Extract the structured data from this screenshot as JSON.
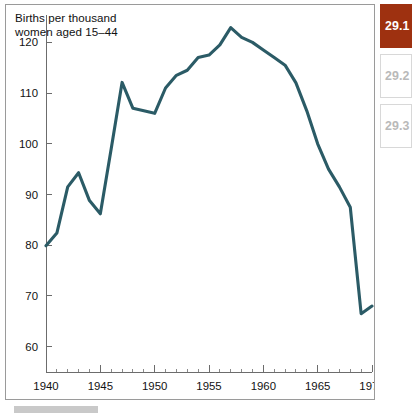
{
  "figure": {
    "title": "Births per thousand\nwomen aged 15–44"
  },
  "tabs": {
    "items": [
      {
        "label": "29.1",
        "state": "active"
      },
      {
        "label": "29.2",
        "state": "inactive"
      },
      {
        "label": "29.3",
        "state": "inactive"
      }
    ]
  },
  "colors": {
    "series_line": "#2b5b66",
    "active_tab_bg": "#9e3110",
    "active_tab_text": "#ffffff",
    "inactive_tab_text": "#b9b9b9",
    "inactive_tab_border": "#d8d8d8",
    "panel_border": "#9a9a9a",
    "axis": "#6c6c6c",
    "caption_bar": "#c9c9c9",
    "background": "#ffffff"
  },
  "axes": {
    "y_ticks": [
      "120",
      "110",
      "100",
      "90",
      "80",
      "70",
      "60"
    ],
    "x_ticks": [
      "1940",
      "1945",
      "1950",
      "1955",
      "1960",
      "1965",
      "1970"
    ]
  },
  "chart_data": {
    "type": "line",
    "title": "Births per thousand women aged 15–44",
    "xlabel": "",
    "ylabel": "Births per thousand women aged 15–44",
    "xlim": [
      1940,
      1970
    ],
    "ylim": [
      55,
      125
    ],
    "grid": false,
    "legend": "none",
    "y_ticks": [
      60,
      70,
      80,
      90,
      100,
      110,
      120
    ],
    "x_ticks": [
      1940,
      1945,
      1950,
      1955,
      1960,
      1965,
      1970
    ],
    "x_minor_tick_interval": 1,
    "line_color": "#2b5b66",
    "x": [
      1940,
      1941,
      1942,
      1943,
      1944,
      1945,
      1946,
      1947,
      1948,
      1949,
      1950,
      1951,
      1952,
      1953,
      1954,
      1955,
      1956,
      1957,
      1958,
      1959,
      1960,
      1961,
      1962,
      1963,
      1964,
      1965,
      1966,
      1967,
      1968,
      1969,
      1970
    ],
    "values": [
      79.9,
      82.4,
      91.5,
      94.3,
      88.8,
      86.2,
      99.0,
      112.1,
      107.0,
      106.5,
      106.0,
      111.0,
      113.5,
      114.5,
      117.0,
      117.5,
      119.5,
      122.9,
      121.0,
      120.0,
      118.5,
      117.0,
      115.5,
      112.0,
      106.5,
      100.0,
      95.0,
      91.5,
      87.5,
      66.5,
      68.0
    ],
    "annotations": [
      {
        "text": "peak",
        "x": 1957,
        "y": 122.9
      }
    ]
  }
}
